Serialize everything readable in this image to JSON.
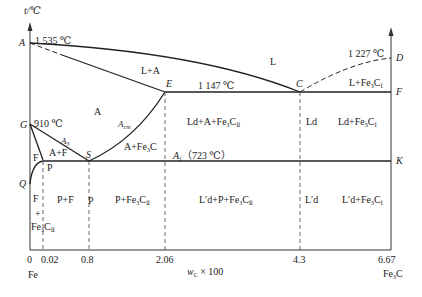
{
  "axes": {
    "y_label": "t/℃",
    "x_label": "w",
    "x_label_sub": "C",
    "x_label_suffix": " × 100",
    "x_ticks": [
      "0",
      "0.02",
      "0.8",
      "2.06",
      "4.3",
      "6.67"
    ],
    "x_left_end": "Fe",
    "x_right_end_main": "Fe",
    "x_right_end_sub": "3",
    "x_right_end_tail": "C"
  },
  "points": {
    "A": "A",
    "D": "D",
    "E": "E",
    "C": "C",
    "F": "F",
    "G": "G",
    "S": "S",
    "P": "P",
    "K": "K",
    "Q": "Q"
  },
  "temperatures": {
    "A": "1 535 ℃",
    "D": "1 227 ℃",
    "ECF": "1 147 ℃",
    "G": "910 ℃",
    "PSK_prefix": "A",
    "PSK_prefix_sub": "1",
    "PSK_value": "（723 ℃）"
  },
  "lines": {
    "A3": "A",
    "A3_sub": "3",
    "Acm": "A",
    "Acm_sub": "cm"
  },
  "regions": {
    "L": "L",
    "L_A": "L+A",
    "L_Fe3C": "L+Fe",
    "L_Fe3C_sub": "3",
    "L_Fe3C_tail": "C",
    "L_Fe3C_sub2": "Ⅰ",
    "A": "A",
    "A_F": "A+F",
    "F_top": "F",
    "A_Fe3C": "A+Fe",
    "A_Fe3C_sub": "3",
    "A_Fe3C_tail": "C",
    "Ld_A_Fe3C": "Ld+A+Fe",
    "Ld_A_Fe3C_sub": "3",
    "Ld_A_Fe3C_tail": "C",
    "Ld_A_Fe3C_sub2": "Ⅱ",
    "Ld": "Ld",
    "Ld_Fe3C": "Ld+Fe",
    "Ld_Fe3C_sub": "3",
    "Ld_Fe3C_tail": "C",
    "Ld_Fe3C_sub2": "Ⅰ",
    "F_bottom": "F",
    "plus": "+",
    "Fe3C_II": "Fe",
    "Fe3C_II_sub": "3",
    "Fe3C_II_tail": "C",
    "Fe3C_II_sub2": "Ⅱ",
    "P_F": "P+F",
    "P": "P",
    "P_Fe3C": "P+Fe",
    "P_Fe3C_sub": "3",
    "P_Fe3C_tail": "C",
    "P_Fe3C_sub2": "Ⅱ",
    "Ld2_P_Fe3C": "L′d+P+Fe",
    "Ld2_P_Fe3C_sub": "3",
    "Ld2_P_Fe3C_tail": "C",
    "Ld2_P_Fe3C_sub2": "Ⅱ",
    "Ld2": "L′d",
    "Ld2_Fe3C": "L′d+Fe",
    "Ld2_Fe3C_sub": "3",
    "Ld2_Fe3C_tail": "C",
    "Ld2_Fe3C_sub2": "Ⅰ"
  }
}
